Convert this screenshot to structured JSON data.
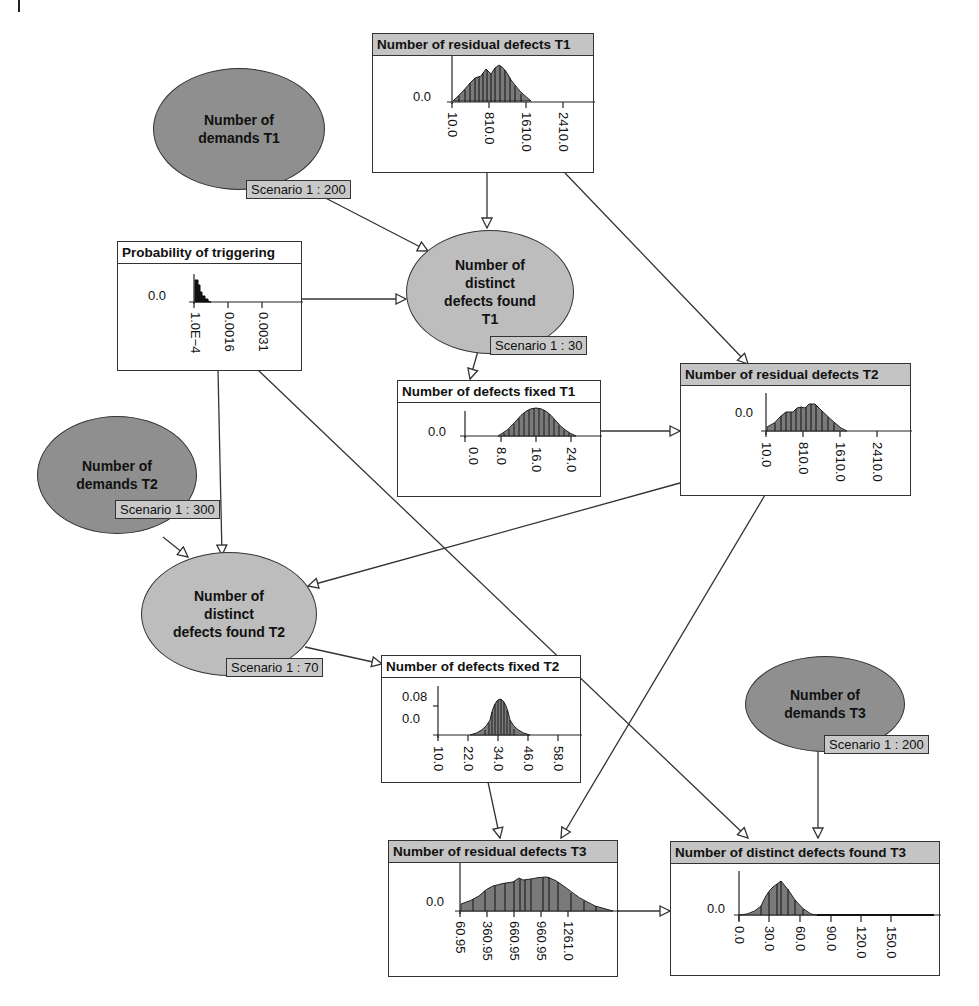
{
  "diagram": {
    "type": "Bayesian network (BBN) – software defect model",
    "nodes": {
      "demands_t1": {
        "label": "Number of demands T1",
        "line1": "Number of",
        "line2": "demands T1",
        "scenario": "Scenario 1 : 200"
      },
      "demands_t2": {
        "label": "Number of demands T2",
        "line1": "Number of",
        "line2": "demands T2",
        "scenario": "Scenario 1 : 300"
      },
      "demands_t3": {
        "label": "Number of demands T3",
        "line1": "Number of",
        "line2": "demands T3",
        "scenario": "Scenario 1 : 200"
      },
      "found_t1": {
        "label": "Number of distinct defects found T1",
        "line1": "Number of distinct",
        "line2": "defects found T1",
        "scenario": "Scenario 1 : 30"
      },
      "found_t2": {
        "label": "Number of distinct defects found T2",
        "line1": "Number of distinct",
        "line2": "defects found T2",
        "scenario": "Scenario 1 : 70"
      },
      "prob_trigger": {
        "title": "Probability of triggering",
        "ylabel": "0.0",
        "xticks": [
          "1.0E−4",
          "0.0016",
          "0.0031"
        ]
      },
      "residual_t1": {
        "title": "Number of residual defects T1",
        "ylabel": "0.0",
        "xticks": [
          "10.0",
          "810.0",
          "1610.0",
          "2410.0"
        ]
      },
      "residual_t2": {
        "title": "Number of residual defects T2",
        "ylabel": "0.0",
        "xticks": [
          "10.0",
          "810.0",
          "1610.0",
          "2410.0"
        ]
      },
      "residual_t3": {
        "title": "Number of residual defects T3",
        "ylabel": "0.0",
        "xticks": [
          "60.95",
          "360.95",
          "660.95",
          "960.95",
          "1261.0"
        ]
      },
      "fixed_t1": {
        "title": "Number of defects fixed T1",
        "ylabel": "0.0",
        "xticks": [
          "0.0",
          "8.0",
          "16.0",
          "24.0"
        ]
      },
      "fixed_t2": {
        "title": "Number of defects fixed T2",
        "ylabel_top": "0.08",
        "ylabel": "0.0",
        "xticks": [
          "10.0",
          "22.0",
          "34.0",
          "46.0",
          "58.0"
        ]
      },
      "found_t3": {
        "title": "Number of distinct defects found T3",
        "ylabel": "0.0",
        "xticks": [
          "0.0",
          "30.0",
          "60.0",
          "90.0",
          "120.0",
          "150.0"
        ]
      }
    },
    "edges": [
      [
        "Number of demands T1",
        "Number of distinct defects found T1"
      ],
      [
        "Number of residual defects T1",
        "Number of distinct defects found T1"
      ],
      [
        "Probability of triggering",
        "Number of distinct defects found T1"
      ],
      [
        "Number of residual defects T1",
        "Number of residual defects T2"
      ],
      [
        "Number of distinct defects found T1",
        "Number of defects fixed T1"
      ],
      [
        "Number of defects fixed T1",
        "Number of residual defects T2"
      ],
      [
        "Number of demands T2",
        "Number of distinct defects found T2"
      ],
      [
        "Probability of triggering",
        "Number of distinct defects found T2"
      ],
      [
        "Number of residual defects T2",
        "Number of distinct defects found T2"
      ],
      [
        "Number of distinct defects found T2",
        "Number of defects fixed T2"
      ],
      [
        "Number of defects fixed T2",
        "Number of residual defects T3"
      ],
      [
        "Number of residual defects T2",
        "Number of residual defects T3"
      ],
      [
        "Probability of triggering",
        "Number of distinct defects found T3"
      ],
      [
        "Number of demands T3",
        "Number of distinct defects found T3"
      ],
      [
        "Number of residual defects T3",
        "Number of distinct defects found T3"
      ]
    ],
    "colors": {
      "observed_node": "#8f8f8f",
      "inferred_node": "#bdbdbd",
      "header_grey": "#c4c4c4",
      "histogram_fill": "#7a7a7a",
      "line": "#333333"
    }
  }
}
